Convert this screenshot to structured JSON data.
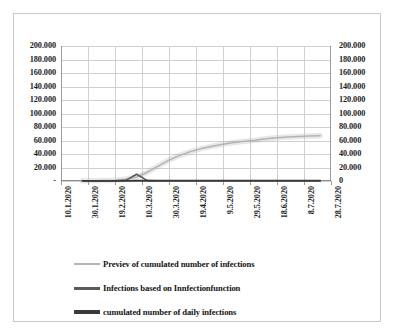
{
  "chart_data": {
    "type": "line",
    "title": "",
    "xlabel": "",
    "ylabel": "",
    "ylim": [
      0,
      200000
    ],
    "grid": true,
    "legend_position": "bottom",
    "dual_axis": true,
    "y_axis_left": {
      "ticks": [
        "200.000",
        "180.000",
        "160.000",
        "140.000",
        "120.000",
        "100.000",
        "80.000",
        "60.000",
        "40.000",
        "20.000",
        "-"
      ],
      "values": [
        200000,
        180000,
        160000,
        140000,
        120000,
        100000,
        80000,
        60000,
        40000,
        20000,
        0
      ]
    },
    "y_axis_right": {
      "ticks": [
        "200.000",
        "180.000",
        "160.000",
        "140.000",
        "120.000",
        "100.000",
        "80.000",
        "60.000",
        "40.000",
        "20.000",
        "0"
      ],
      "values": [
        200000,
        180000,
        160000,
        140000,
        120000,
        100000,
        80000,
        60000,
        40000,
        20000,
        0
      ]
    },
    "x_tick_labels": [
      "10.1.2020",
      "30.1.2020",
      "19.2.2020",
      "10.3.2020",
      "30.3.2020",
      "19.4.2020",
      "9.5.2020",
      "29.5.2020",
      "18.6.2020",
      "8.7.2020",
      "28.7.2020"
    ],
    "x": [
      "10.1.2020",
      "20.1.2020",
      "30.1.2020",
      "9.2.2020",
      "19.2.2020",
      "29.2.2020",
      "10.3.2020",
      "15.3.2020",
      "20.3.2020",
      "25.3.2020",
      "30.3.2020",
      "4.4.2020",
      "9.4.2020",
      "14.4.2020",
      "19.4.2020",
      "24.4.2020",
      "29.4.2020",
      "4.5.2020",
      "9.5.2020",
      "19.5.2020",
      "29.5.2020",
      "8.6.2020",
      "18.6.2020",
      "28.6.2020",
      "8.7.2020",
      "28.7.2020"
    ],
    "series": [
      {
        "name": "Previev of cumulated number of infections",
        "color": "#b3b3b3",
        "width": 1.5,
        "values": [
          null,
          null,
          200,
          400,
          700,
          1200,
          2500,
          6000,
          13000,
          22000,
          31000,
          38000,
          43500,
          48000,
          51500,
          54500,
          57000,
          59000,
          60500,
          62500,
          64000,
          65200,
          66000,
          66600,
          67000,
          null
        ]
      },
      {
        "name": "Infections based on Innfectionfunction",
        "color": "#5a5a5a",
        "width": 1.6,
        "values": [
          null,
          null,
          150,
          200,
          250,
          400,
          900,
          10000,
          500,
          300,
          250,
          220,
          200,
          180,
          170,
          160,
          150,
          150,
          140,
          140,
          130,
          130,
          120,
          120,
          120,
          null
        ]
      },
      {
        "name": "cumulated number of daily infections",
        "color": "#3a3a3a",
        "width": 1.8,
        "values": [
          null,
          null,
          100,
          150,
          180,
          220,
          300,
          350,
          380,
          400,
          410,
          420,
          420,
          430,
          430,
          430,
          430,
          430,
          430,
          430,
          430,
          430,
          430,
          430,
          430,
          null
        ]
      }
    ],
    "annotations": [
      {
        "text": "sharp spike in infections based on infectionfunction",
        "near_x": "15.3.2020",
        "approx_y": 10000
      }
    ]
  },
  "legend": {
    "items": [
      {
        "label": "Previev of cumulated number of infections",
        "swatch": "thin-line-swatch"
      },
      {
        "label": "Infections based on Innfectionfunction",
        "swatch": "medium-line-swatch"
      },
      {
        "label": "cumulated number of daily infections",
        "swatch": "thick-line-swatch"
      }
    ]
  }
}
